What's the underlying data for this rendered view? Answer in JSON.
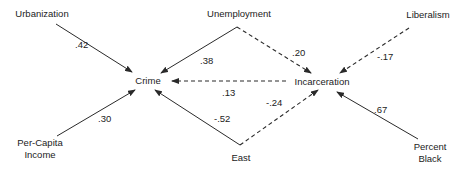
{
  "diagram": {
    "type": "path-diagram",
    "nodes": [
      {
        "id": "urbanization",
        "lines": [
          "Urbanization"
        ],
        "x": 42,
        "y": 17
      },
      {
        "id": "unemployment",
        "lines": [
          "Unemployment"
        ],
        "x": 239,
        "y": 17
      },
      {
        "id": "liberalism",
        "lines": [
          "Liberalism"
        ],
        "x": 428,
        "y": 18
      },
      {
        "id": "crime",
        "lines": [
          "Crime"
        ],
        "x": 148,
        "y": 84
      },
      {
        "id": "incarceration",
        "lines": [
          "Incarceration"
        ],
        "x": 322,
        "y": 85
      },
      {
        "id": "per-capita-income",
        "lines": [
          "Per-Capita",
          "Income"
        ],
        "x": 40,
        "y": 146
      },
      {
        "id": "east",
        "lines": [
          "East"
        ],
        "x": 241,
        "y": 161
      },
      {
        "id": "percent-black",
        "lines": [
          "Percent",
          "Black"
        ],
        "x": 430,
        "y": 150
      }
    ],
    "edges": [
      {
        "id": "urbanization-crime",
        "from": "Urbanization",
        "to": "Crime",
        "coefficient": ".42",
        "style": "solid",
        "x1": 56,
        "y1": 24,
        "x2": 132,
        "y2": 72,
        "lx": 75,
        "ly": 48
      },
      {
        "id": "unemployment-crime",
        "from": "Unemployment",
        "to": "Crime",
        "coefficient": ".38",
        "style": "solid",
        "x1": 237,
        "y1": 27,
        "x2": 161,
        "y2": 73,
        "lx": 200,
        "ly": 64
      },
      {
        "id": "unemployment-incarceration",
        "from": "Unemployment",
        "to": "Incarceration",
        "coefficient": ".20",
        "style": "dashed",
        "x1": 237,
        "y1": 27,
        "x2": 311,
        "y2": 73,
        "lx": 292,
        "ly": 56
      },
      {
        "id": "liberalism-incarceration",
        "from": "Liberalism",
        "to": "Incarceration",
        "coefficient": "-.17",
        "style": "dashed",
        "x1": 409,
        "y1": 28,
        "x2": 340,
        "y2": 73,
        "lx": 377,
        "ly": 60
      },
      {
        "id": "incarceration-crime",
        "from": "Incarceration",
        "to": "Crime",
        "coefficient": ".13",
        "style": "dashed",
        "x1": 286,
        "y1": 81,
        "x2": 172,
        "y2": 81,
        "lx": 222,
        "ly": 96
      },
      {
        "id": "per-capita-income-crime",
        "from": "Per-Capita Income",
        "to": "Crime",
        "coefficient": ".30",
        "style": "solid",
        "x1": 57,
        "y1": 136,
        "x2": 135,
        "y2": 90,
        "lx": 98,
        "ly": 122
      },
      {
        "id": "east-crime",
        "from": "East",
        "to": "Crime",
        "coefficient": "-.52",
        "style": "solid",
        "x1": 240,
        "y1": 145,
        "x2": 155,
        "y2": 90,
        "lx": 214,
        "ly": 122
      },
      {
        "id": "east-incarceration",
        "from": "East",
        "to": "Incarceration",
        "coefficient": "-.24",
        "style": "dashed",
        "x1": 240,
        "y1": 145,
        "x2": 318,
        "y2": 90,
        "lx": 266,
        "ly": 106
      },
      {
        "id": "percent-black-incarceration",
        "from": "Percent Black",
        "to": "Incarceration",
        "coefficient": ".67",
        "style": "solid",
        "x1": 418,
        "y1": 139,
        "x2": 337,
        "y2": 92,
        "lx": 374,
        "ly": 113
      }
    ],
    "colors": {
      "line": "#2a2a2a",
      "text": "#222222",
      "background": "#ffffff"
    }
  }
}
